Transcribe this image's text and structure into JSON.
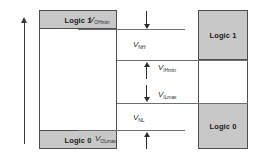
{
  "diagram": {
    "colors": {
      "box_fill": "#c8c8c8",
      "box_border": "#4d4d4d",
      "level_line": "#6e6e6e",
      "arrow": "#2e2e2e",
      "axis": "#3a3a3a",
      "text": "#1a1a1a"
    },
    "driver_column": {
      "high_box_label": "Logic 1",
      "low_box_label": "Logic 0"
    },
    "receiver_column": {
      "high_box_label": "Logic 1",
      "low_box_label": "Logic 0"
    },
    "levels": [
      {
        "symbol": "V",
        "subscript": "OHmin"
      },
      {
        "symbol": "V",
        "subscript": "IHmin"
      },
      {
        "symbol": "V",
        "subscript": "ILmax"
      },
      {
        "symbol": "V",
        "subscript": "OLmax"
      }
    ],
    "noise_margins": [
      {
        "symbol": "V",
        "subscript": "NH"
      },
      {
        "symbol": "V",
        "subscript": "NL"
      }
    ]
  }
}
